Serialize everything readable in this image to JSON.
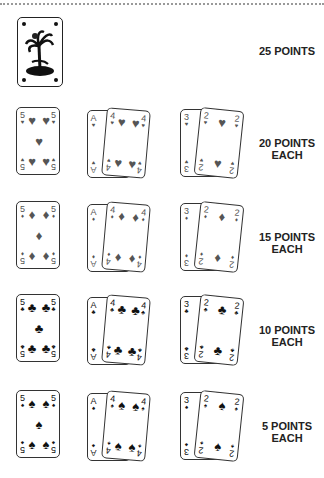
{
  "top_card": {
    "label": "25 POINTS",
    "icon": "palm-tree-joker-icon"
  },
  "rows": [
    {
      "suit": "♥",
      "suit_name": "hearts",
      "tone": "red",
      "label_line1": "20 POINTS",
      "label_line2": "EACH",
      "cards": [
        "5",
        "A",
        "4",
        "3",
        "2"
      ]
    },
    {
      "suit": "♦",
      "suit_name": "diamonds",
      "tone": "red",
      "label_line1": "15 POINTS",
      "label_line2": "EACH",
      "cards": [
        "5",
        "A",
        "4",
        "3",
        "2"
      ]
    },
    {
      "suit": "♣",
      "suit_name": "clubs",
      "tone": "blk",
      "label_line1": "10 POINTS",
      "label_line2": "EACH",
      "cards": [
        "5",
        "A",
        "4",
        "3",
        "2"
      ]
    },
    {
      "suit": "♠",
      "suit_name": "spades",
      "tone": "blk",
      "label_line1": "5 POINTS",
      "label_line2": "EACH",
      "cards": [
        "5",
        "A",
        "4",
        "3",
        "2"
      ]
    }
  ]
}
